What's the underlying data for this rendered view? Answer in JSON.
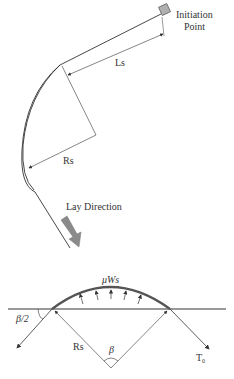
{
  "labels": {
    "initiation_line1": "Initiation",
    "initiation_line2": "Point",
    "ls": "Ls",
    "rs_top": "Rs",
    "lay_direction": "Lay Direction",
    "friction": "μWs",
    "half_beta": "β/2",
    "rs_bottom": "Rs",
    "beta": "β",
    "tension": "T",
    "tension_sub": "0"
  },
  "colors": {
    "line": "#333333",
    "thick_arc": "#555555",
    "arrow_fill": "#8a8a8a",
    "square_fill": "#b0b0b0"
  }
}
